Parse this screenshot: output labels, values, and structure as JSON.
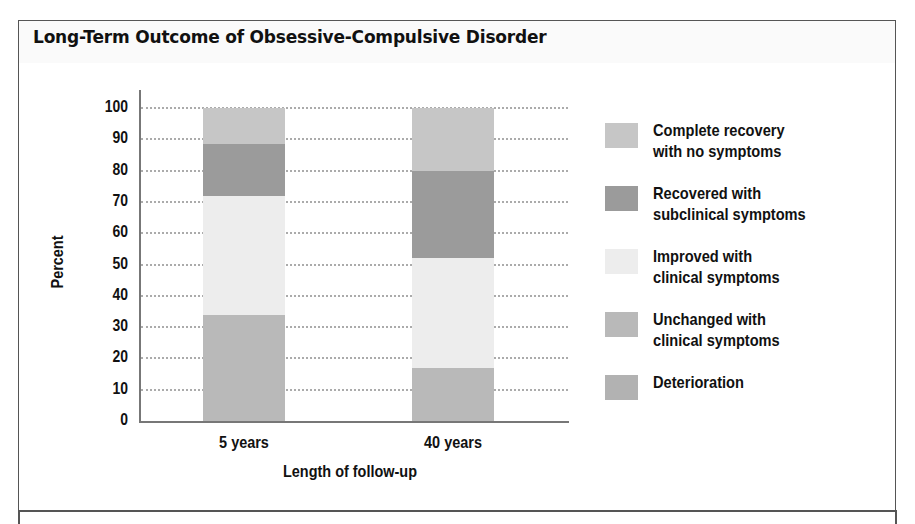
{
  "title": "Long-Term Outcome of Obsessive-Compulsive Disorder",
  "colors": {
    "complete_recovery": "#c6c6c6",
    "recovered_subclinical": "#9b9b9b",
    "improved_clinical": "#ededed",
    "unchanged_clinical": "#b9b9b9",
    "deterioration": "#b2b2b2"
  },
  "chart_data": {
    "type": "bar",
    "stacked": true,
    "title": "Long-Term Outcome of Obsessive-Compulsive Disorder",
    "xlabel": "Length of follow-up",
    "ylabel": "Percent",
    "ylim": [
      0,
      100
    ],
    "yticks": [
      0,
      10,
      20,
      30,
      40,
      50,
      60,
      70,
      80,
      90,
      100
    ],
    "grid": "horizontal dotted",
    "legend_position": "right",
    "categories": [
      "5 years",
      "40 years"
    ],
    "series": [
      {
        "name": "Deterioration",
        "values": [
          0,
          0
        ]
      },
      {
        "name": "Unchanged with clinical symptoms",
        "values": [
          34,
          17
        ]
      },
      {
        "name": "Improved with clinical symptoms",
        "values": [
          38,
          35
        ]
      },
      {
        "name": "Recovered with subclinical symptoms",
        "values": [
          16.5,
          28
        ]
      },
      {
        "name": "Complete recovery with no symptoms",
        "values": [
          11.5,
          20
        ]
      }
    ]
  },
  "legend": [
    {
      "key": "complete_recovery",
      "label": "Complete recovery\nwith no symptoms"
    },
    {
      "key": "recovered_subclinical",
      "label": "Recovered with\nsubclinical symptoms"
    },
    {
      "key": "improved_clinical",
      "label": "Improved with\nclinical symptoms"
    },
    {
      "key": "unchanged_clinical",
      "label": "Unchanged with\nclinical symptoms"
    },
    {
      "key": "deterioration",
      "label": "Deterioration"
    }
  ]
}
